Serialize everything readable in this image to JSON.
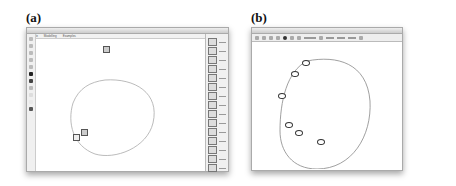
{
  "figure": {
    "panels": [
      {
        "label": "(a)",
        "window_title": "...",
        "menu": [
          "File",
          "Modelling",
          "Examples"
        ],
        "toolbar_tools": [
          "select",
          "pencil",
          "eraser",
          "line",
          "zoom",
          "black-color",
          "dark-color",
          "gray-color",
          "light-color",
          "lighter-color",
          "dark-swatch"
        ],
        "palette_title": "Palette",
        "palette_items": 16,
        "canvas": {
          "shape": "closed-loop",
          "nodes": 3
        }
      },
      {
        "label": "(b)",
        "window_title": "...",
        "toolbar_items": 22,
        "canvas": {
          "shape": "closed-loop",
          "markers": 6
        }
      }
    ]
  }
}
